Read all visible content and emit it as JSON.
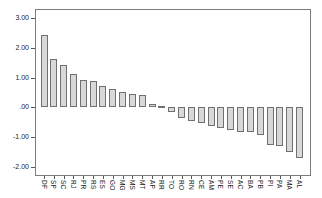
{
  "chart_data": {
    "type": "bar",
    "title": "",
    "xlabel": "",
    "ylabel": "",
    "categories": [
      "DF",
      "SP",
      "SC",
      "RJ",
      "PR",
      "RS",
      "ES",
      "GO",
      "MG",
      "MS",
      "MT",
      "AP",
      "RR",
      "TO",
      "RO",
      "RN",
      "CE",
      "AM",
      "PE",
      "SE",
      "AC",
      "BA",
      "PB",
      "PI",
      "PA",
      "MA",
      "AL"
    ],
    "values": [
      2.42,
      1.63,
      1.43,
      1.13,
      0.93,
      0.87,
      0.73,
      0.62,
      0.53,
      0.46,
      0.42,
      0.1,
      0.06,
      -0.17,
      -0.37,
      -0.46,
      -0.53,
      -0.61,
      -0.68,
      -0.77,
      -0.82,
      -0.84,
      -0.93,
      -1.26,
      -1.3,
      -1.49,
      -1.71
    ],
    "yticks": [
      3,
      2,
      1,
      0,
      -1,
      -2
    ],
    "ytick_labels": [
      "3.00",
      "2.00",
      "1.00",
      ".00",
      "-1.00",
      "-2.00"
    ],
    "ylim": [
      -2.3,
      3.3
    ],
    "grid": false,
    "legend": null,
    "colors": {
      "bar_fill": "#d8d8d8",
      "bar_border": "#707070",
      "axis_line": "#7c7c7c",
      "tick_mark": "#555555",
      "label_text": "#1c1c1c",
      "background": "#ffffff"
    }
  }
}
